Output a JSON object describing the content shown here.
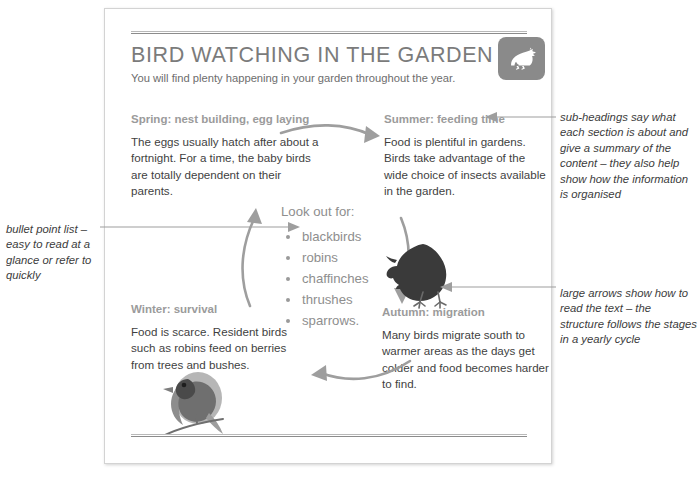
{
  "document": {
    "title": "BIRD WATCHING IN THE GARDEN",
    "subtitle": "You will find plenty happening in your garden throughout the year.",
    "logo_icon": "bird-icon"
  },
  "seasons": [
    {
      "id": "spring",
      "heading": "Spring: nest building, egg laying",
      "body": "The eggs usually hatch after about a fortnight. For a time, the baby birds are totally dependent on their parents."
    },
    {
      "id": "summer",
      "heading": "Summer: feeding time",
      "body": "Food is plentiful in gardens. Birds take advantage of the wide choice of insects available in the garden."
    },
    {
      "id": "autumn",
      "heading": "Autumn: migration",
      "body": "Many birds migrate south to warmer areas as the days get colder and food becomes harder to find."
    },
    {
      "id": "winter",
      "heading": "Winter: survival",
      "body": "Food is scarce. Resident birds such as robins feed on berries from trees and bushes."
    }
  ],
  "lookout": {
    "title": "Look out for:",
    "items": [
      "blackbirds",
      "robins",
      "chaffinches",
      "thrushes",
      "sparrows."
    ]
  },
  "annotations": [
    {
      "id": "left",
      "text": "bullet point list – easy to read at a glance or refer to quickly",
      "target": "lookout-list"
    },
    {
      "id": "top-right",
      "text": "sub-headings say what each section is about and give a summary of the content – they also help show how the information is organised",
      "target": "season-heading-summer"
    },
    {
      "id": "bottom-right",
      "text": "large arrows show how to read the text – the structure follows the stages in a yearly cycle",
      "target": "cycle-arrow-summer-autumn"
    }
  ],
  "illustrations": [
    {
      "id": "blackbird-illustration",
      "name": "blackbird-icon"
    },
    {
      "id": "robin-illustration",
      "name": "robin-icon"
    }
  ],
  "colors": {
    "heading_grey": "#7b7b7b",
    "subhead_grey": "#9b9b9b",
    "body_grey": "#3f3f3f",
    "list_grey": "#8e8e8e",
    "arrow_grey": "#9e9e9e",
    "badge_grey": "#8a8a8a",
    "annotation_grey": "#3c3c3c",
    "page_border": "#d3d3d3"
  }
}
